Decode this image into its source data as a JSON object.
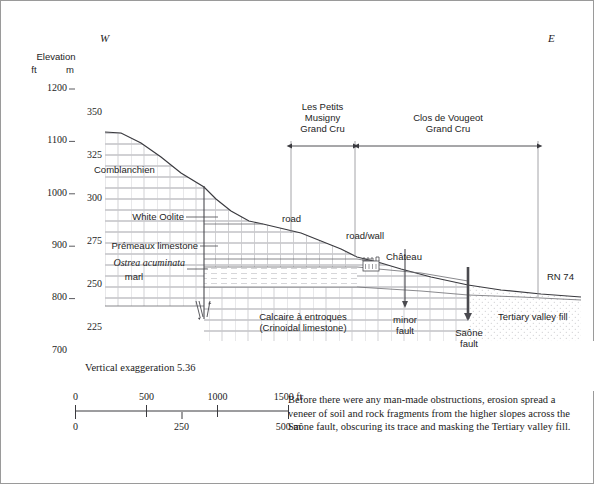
{
  "figure": {
    "title_direction_west": "W",
    "title_direction_east": "E",
    "vertical_exaggeration": "Vertical exaggeration 5.36",
    "caption": "Before there were any man-made obstructions, erosion spread a veneer of soil and rock fragments from the higher slopes across the Saône fault, obscuring its trace and masking the Tertiary valley fill."
  },
  "axis": {
    "title": "Elevation",
    "unit_left": "ft",
    "unit_right": "m",
    "ft_ticks": [
      "1200",
      "1100",
      "1000",
      "900",
      "800",
      "700"
    ],
    "ft_values": [
      1200,
      1100,
      1000,
      900,
      800,
      700
    ],
    "m_ticks": [
      "350",
      "325",
      "300",
      "275",
      "250",
      "225"
    ],
    "m_values": [
      350,
      325,
      300,
      275,
      250,
      225
    ],
    "ft_range": [
      700,
      1200
    ]
  },
  "vineyards": [
    {
      "name": "les-petits-musigny",
      "line1": "Les Petits",
      "line2": "Musigny",
      "line3": "Grand Cru"
    },
    {
      "name": "clos-de-vougeot",
      "line1": "Clos de Vougeot",
      "line2": "Grand Cru",
      "line3": ""
    }
  ],
  "strata_labels": [
    {
      "name": "comblanchien",
      "text": "Comblanchien",
      "italic": false
    },
    {
      "name": "white-oolite",
      "text": "White Oolite",
      "italic": false
    },
    {
      "name": "premeaux-limestone",
      "text": "Prémeaux limestone",
      "italic": false
    },
    {
      "name": "ostrea-acuminata",
      "text": "Ostrea acuminata",
      "italic": true
    },
    {
      "name": "ostrea-marl",
      "text": "marl",
      "italic": false
    },
    {
      "name": "calcaire-entroques-1",
      "text": "Calcaire à entroques",
      "italic": false
    },
    {
      "name": "calcaire-entroques-2",
      "text": "(Crinoidal limestone)",
      "italic": false
    },
    {
      "name": "tertiary-valley-fill",
      "text": "Tertiary valley fill",
      "italic": false
    }
  ],
  "features": [
    {
      "name": "road",
      "text": "road"
    },
    {
      "name": "road-wall",
      "text": "road/wall"
    },
    {
      "name": "chateau",
      "text": "Château"
    },
    {
      "name": "rn74",
      "text": "RN 74"
    }
  ],
  "faults": [
    {
      "name": "minor-fault",
      "line1": "minor",
      "line2": "fault"
    },
    {
      "name": "saone-fault",
      "line1": "Saône",
      "line2": "fault"
    }
  ],
  "scalebar": {
    "ft_labels": [
      "0",
      "500",
      "1000",
      "1500 ft"
    ],
    "m_labels": [
      "0",
      "250",
      "500 m"
    ],
    "ft_values": [
      0,
      500,
      1000,
      1500
    ],
    "m_values": [
      0,
      250,
      500
    ]
  },
  "colors": {
    "ink": "#1a1a1a",
    "rule": "#55555a",
    "hatch": "#b9b9bd",
    "stipple": "#c2c2c6",
    "border": "#9a9a9a"
  }
}
